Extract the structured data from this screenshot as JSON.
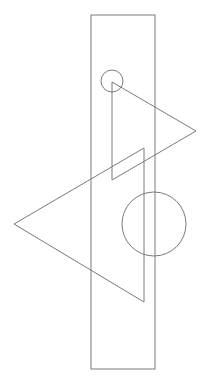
{
  "canvas": {
    "width": 208,
    "height": 387,
    "background": "#ffffff",
    "stroke": "#7a7a7a"
  },
  "shapes": {
    "rectangle": {
      "x": 91,
      "y": 15,
      "width": 64,
      "height": 354
    },
    "small_circle": {
      "cx": 112,
      "cy": 81,
      "r": 11
    },
    "big_circle": {
      "cx": 154,
      "cy": 224,
      "r": 32
    },
    "right_triangle": {
      "points": "112,82 196,131 112,180"
    },
    "left_triangle": {
      "points": "144,148 14,224 144,302"
    }
  }
}
